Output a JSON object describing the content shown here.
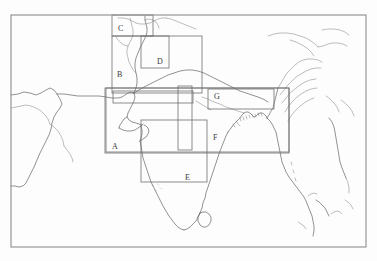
{
  "figure": {
    "type": "region-of-interest-map",
    "title": "",
    "caption": "",
    "background_color": "#ffffff",
    "frame_color": "#8c8c8c",
    "coastline_color": "#4a4a4a",
    "box_outline_color": "#6f6f6f",
    "label_color": "#3a3a3a",
    "width": 377,
    "height": 261
  },
  "frame": {
    "x": 11,
    "y": 15,
    "width": 355,
    "height": 232
  },
  "regions": [
    {
      "id": "A",
      "label": "A",
      "label_x": 112,
      "label_y": 143,
      "x": 105,
      "y": 88,
      "width": 184,
      "height": 65
    },
    {
      "id": "B",
      "label": "B",
      "label_x": 117,
      "label_y": 71,
      "x": 112,
      "y": 36,
      "width": 90,
      "height": 57
    },
    {
      "id": "C",
      "label": "C",
      "label_x": 118,
      "label_y": 25,
      "x": 112,
      "y": 15,
      "width": 41,
      "height": 21
    },
    {
      "id": "D",
      "label": "D",
      "label_x": 157,
      "label_y": 58,
      "x": 141,
      "y": 36,
      "width": 28,
      "height": 32
    },
    {
      "id": "E",
      "label": "E",
      "label_x": 185,
      "label_y": 174,
      "x": 141,
      "y": 120,
      "width": 66,
      "height": 62
    },
    {
      "id": "F",
      "label": "F",
      "label_x": 213,
      "label_y": 134,
      "x": 106,
      "y": 88,
      "width": 183,
      "height": 64
    },
    {
      "id": "G",
      "label": "G",
      "label_x": 214,
      "label_y": 93,
      "x": 208,
      "y": 89,
      "width": 66,
      "height": 20
    }
  ],
  "extra_boxes": [
    {
      "id": "thin-horizontal-band",
      "x": 113,
      "y": 91,
      "width": 80,
      "height": 12
    },
    {
      "id": "vertical-band",
      "x": 178,
      "y": 86,
      "width": 14,
      "height": 64
    }
  ]
}
